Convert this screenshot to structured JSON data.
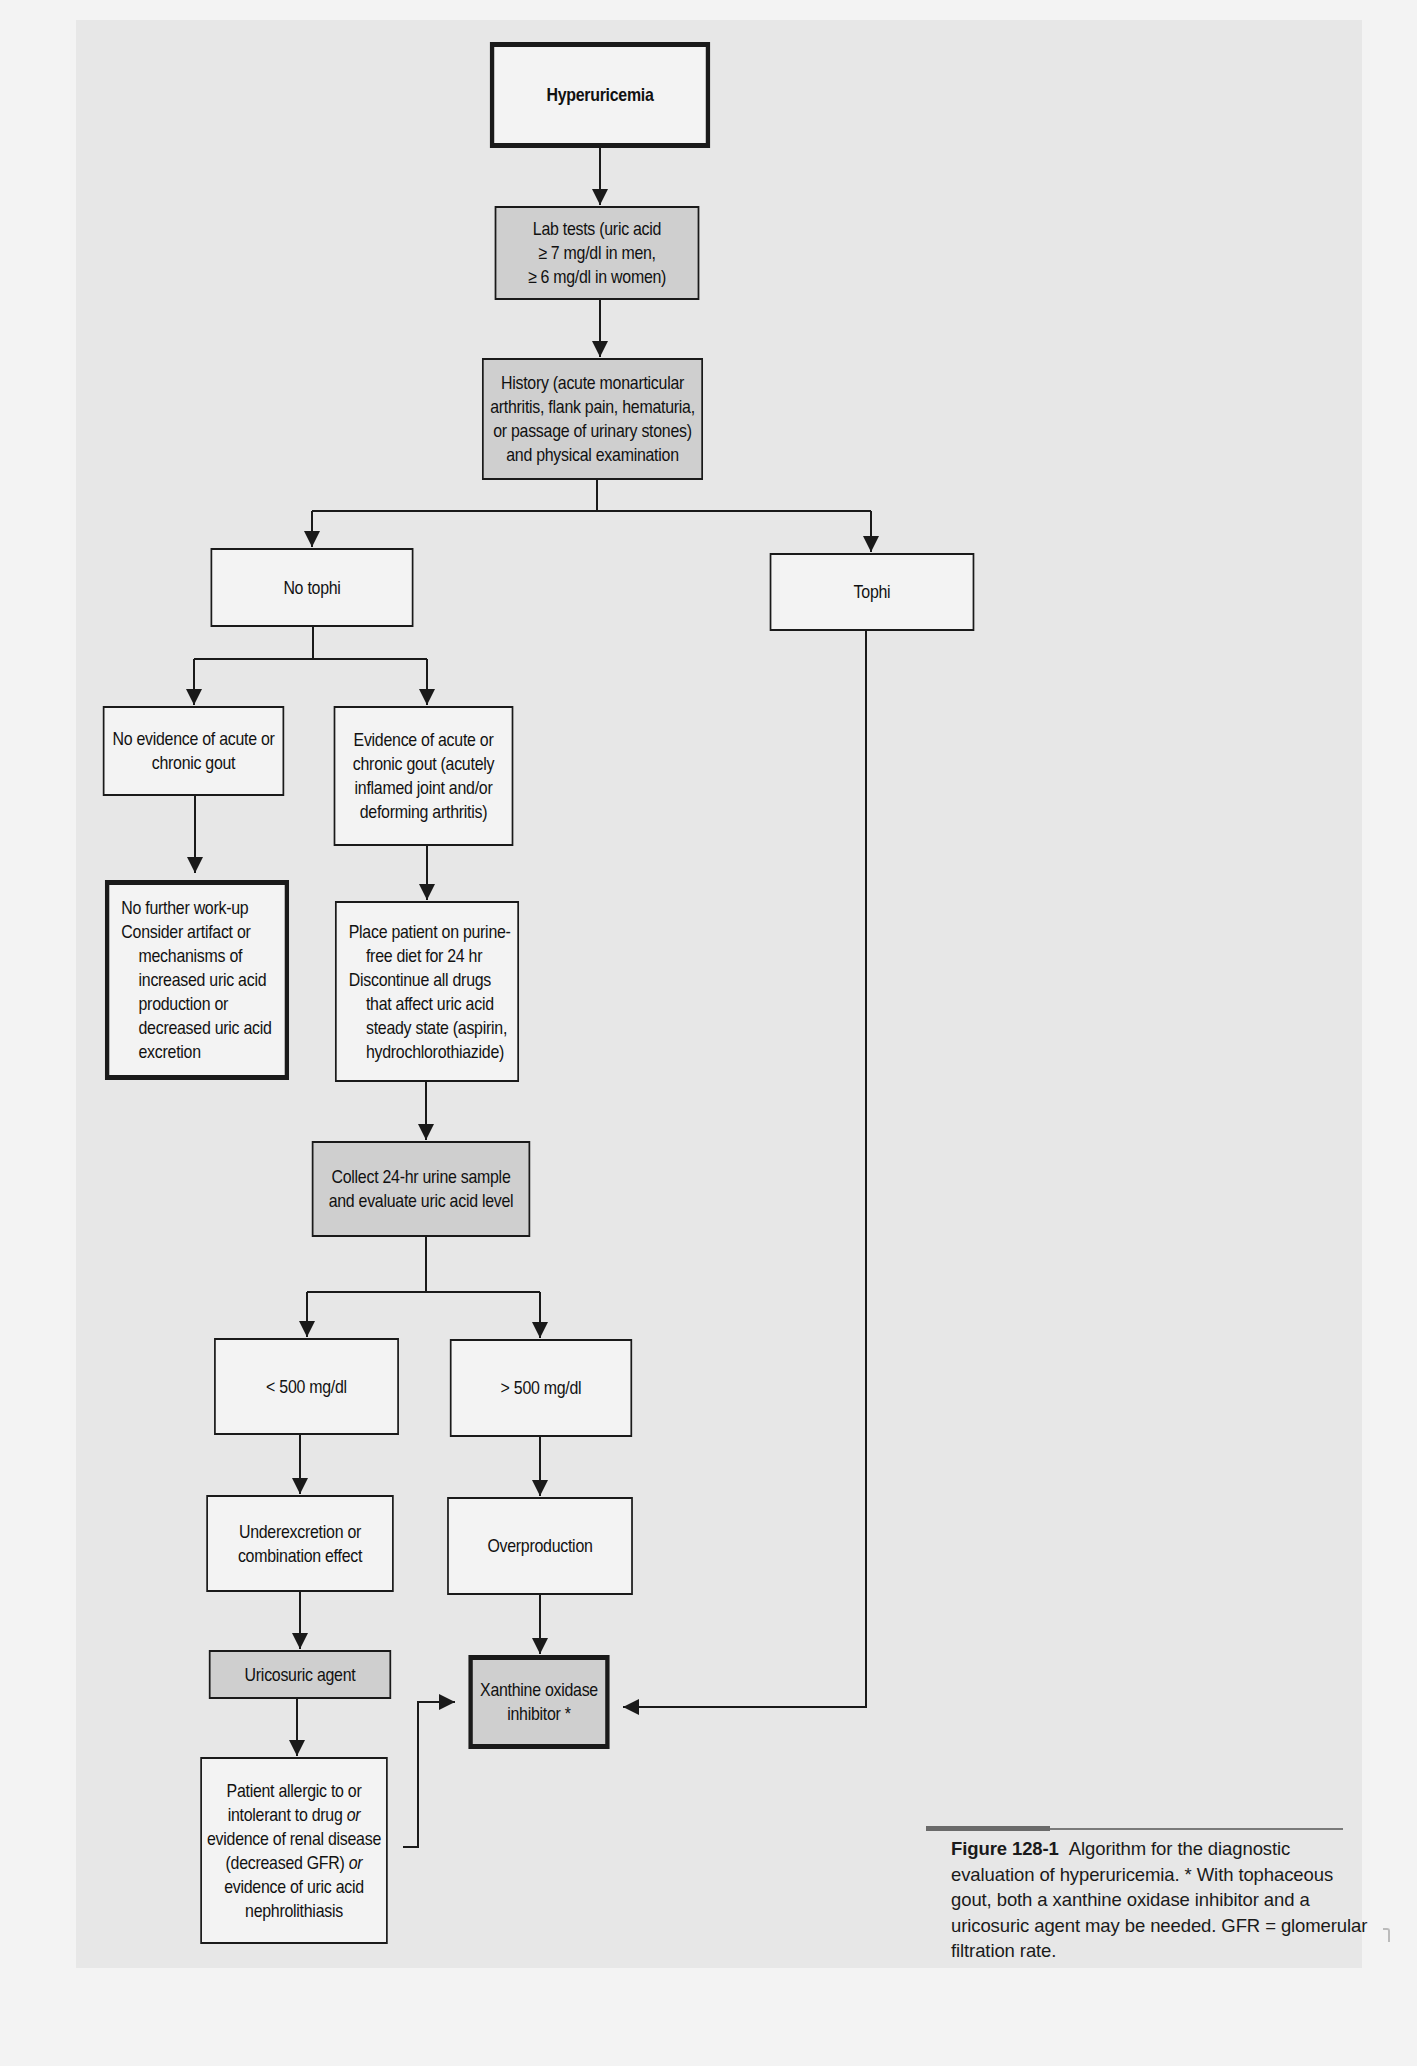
{
  "colors": {
    "page_background": "#f3f3f3",
    "panel_background": "#e7e7e7",
    "box_fill": "#f3f3f3",
    "shaded_fill": "#cfcfcf",
    "line": "#1a1a1a"
  },
  "flowchart": {
    "hyperuricemia": "Hyperuricemia",
    "lab_tests": "Lab tests (uric acid\n≥ 7 mg/dl in men,\n≥ 6 mg/dl in women)",
    "history": "History (acute monarticular\narthritis, flank pain, hematuria,\nor passage of urinary stones)\nand physical examination",
    "no_tophi": "No tophi",
    "tophi": "Tophi",
    "no_evidence": "No evidence of acute or\nchronic gout",
    "evidence": "Evidence of acute or\nchronic gout (acutely\ninflamed joint and/or\ndeforming arthritis)",
    "no_further": {
      "line1": "No further work-up",
      "line2": "Consider artifact or",
      "line3": "mechanisms of\nincreased uric acid\nproduction or\ndecreased uric acid\nexcretion"
    },
    "place_patient": {
      "line1": "Place patient on purine-",
      "line2": "free diet for 24 hr",
      "line3": "Discontinue all drugs",
      "line4": "that affect uric acid\nsteady state (aspirin,\nhydrochlorothiazide)"
    },
    "collect_urine": "Collect 24-hr urine sample\nand evaluate uric acid level",
    "less_500": "< 500 mg/dl",
    "greater_500": "> 500 mg/dl",
    "underexcretion": "Underexcretion or\ncombination effect",
    "overproduction": "Overproduction",
    "uricosuric": "Uricosuric agent",
    "xanthine": "Xanthine oxidase\ninhibitor *",
    "patient_allergic": {
      "a": "Patient allergic to or\nintolerant to drug ",
      "or1": "or",
      "b": "\nevidence of renal disease\n(decreased GFR) ",
      "or2": "or",
      "c": "\nevidence of uric acid\nnephrolithiasis"
    }
  },
  "caption": {
    "figure_label": "Figure 128-1",
    "text": "Algorithm for the diagnostic evaluation of hyperuricemia. * With tophaceous gout, both a xanthine oxidase inhibitor and a uricosuric agent may be needed. GFR = glomerular filtration rate."
  }
}
